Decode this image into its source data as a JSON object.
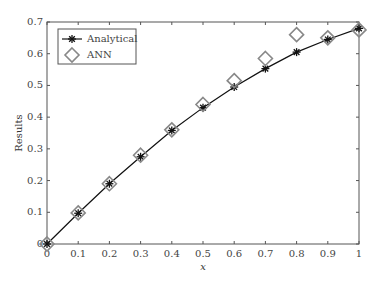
{
  "chart_data": {
    "type": "line",
    "title": "",
    "xlabel": "x",
    "ylabel": "Results",
    "xlim": [
      0,
      1
    ],
    "ylim": [
      0,
      0.7
    ],
    "grid": false,
    "legend_position": "upper left",
    "x": [
      0,
      0.1,
      0.2,
      0.3,
      0.4,
      0.5,
      0.6,
      0.7,
      0.8,
      0.9,
      1.0
    ],
    "x_ticks": [
      "0",
      "0.1",
      "0.2",
      "0.3",
      "0.4",
      "0.5",
      "0.6",
      "0.7",
      "0.8",
      "0.9",
      "1"
    ],
    "y_ticks": [
      "0",
      "0.1",
      "0.2",
      "0.3",
      "0.4",
      "0.5",
      "0.6",
      "0.7"
    ],
    "series": [
      {
        "name": "Analytical",
        "marker": "asterisk",
        "line": "solid",
        "values": [
          0,
          0.097,
          0.19,
          0.275,
          0.358,
          0.43,
          0.495,
          0.553,
          0.605,
          0.645,
          0.68
        ]
      },
      {
        "name": "ANN",
        "marker": "diamond",
        "line": "none",
        "values": [
          0,
          0.098,
          0.19,
          0.28,
          0.36,
          0.44,
          0.515,
          0.585,
          0.66,
          0.65,
          0.675
        ]
      }
    ]
  }
}
